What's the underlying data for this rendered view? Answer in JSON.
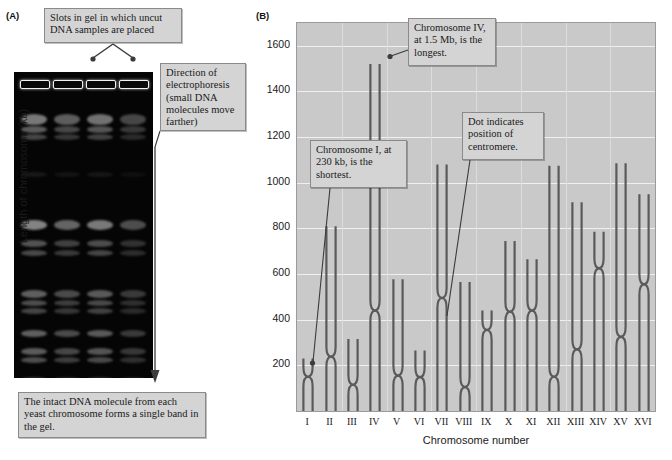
{
  "figure": {
    "panel_a_label": "(A)",
    "panel_b_label": "(B)"
  },
  "panel_a": {
    "callout_slots": "Slots in gel in which uncut DNA samples are placed",
    "callout_direction": "Direction of electrophoresis (small DNA molecules move farther)",
    "callout_intact": "The intact DNA molecule from each yeast chromosome forms a single band in the gel.",
    "lanes": 4,
    "gel_background": "#050505",
    "band_color": "#e8e8e8"
  },
  "panel_b": {
    "callout_shortest": "Chromosome I, at 230 kb, is the shortest.",
    "callout_longest": "Chromosome IV, at 1.5 Mb, is the longest.",
    "callout_centromere": "Dot indicates position of centromere.",
    "plot_background": "#c9c9c9",
    "chromosome_color": "#5a5a5a"
  },
  "chart_data": {
    "type": "bar",
    "title": "",
    "xlabel": "Chromosome number",
    "ylabel": "Length of chromosome (kb)",
    "ylim": [
      0,
      1700
    ],
    "yticks": [
      200,
      400,
      600,
      800,
      1000,
      1200,
      1400,
      1600
    ],
    "grid": true,
    "legend": "none",
    "categories": [
      "I",
      "II",
      "III",
      "IV",
      "V",
      "VI",
      "VII",
      "VIII",
      "IX",
      "X",
      "XI",
      "XII",
      "XIII",
      "XIV",
      "XV",
      "XVI"
    ],
    "values": [
      230,
      810,
      315,
      1520,
      577,
      265,
      1080,
      565,
      440,
      745,
      665,
      1075,
      915,
      785,
      1085,
      950
    ],
    "series": [
      {
        "name": "Length of chromosome (kb)",
        "values": [
          230,
          810,
          315,
          1520,
          577,
          265,
          1080,
          565,
          440,
          745,
          665,
          1075,
          915,
          785,
          1085,
          950
        ]
      },
      {
        "name": "Centromere position (kb)",
        "values": [
          150,
          238,
          115,
          440,
          155,
          148,
          495,
          105,
          355,
          435,
          440,
          150,
          270,
          625,
          325,
          555
        ]
      }
    ],
    "annotations": [
      {
        "text": "Chromosome I, at 230 kb, is the shortest.",
        "target": "I"
      },
      {
        "text": "Chromosome IV, at 1.5 Mb, is the longest.",
        "target": "IV"
      },
      {
        "text": "Dot indicates position of centromere.",
        "target": "VII"
      }
    ]
  }
}
